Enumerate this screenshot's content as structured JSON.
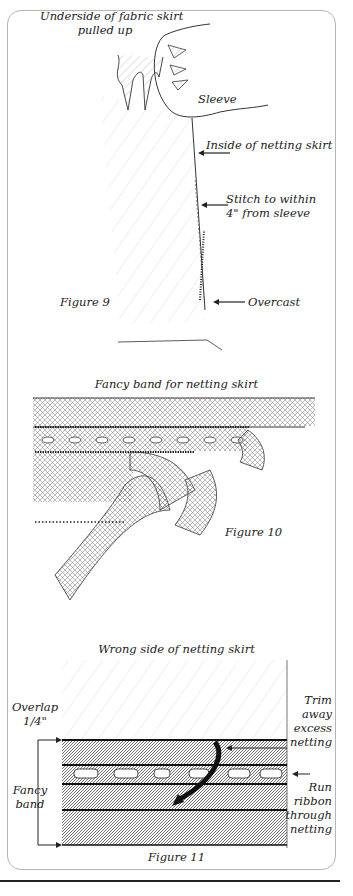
{
  "figure9": {
    "caption": "Figure 9",
    "labels": {
      "underside_line1": "Underside of fabric skirt",
      "underside_line2": "pulled up",
      "sleeve": "Sleeve",
      "inside_netting": "Inside of netting skirt",
      "stitch_line1": "Stitch to within",
      "stitch_line2": "4\" from sleeve",
      "overcast": "Overcast"
    }
  },
  "figure10": {
    "title": "Fancy band for netting skirt",
    "caption": "Figure 10"
  },
  "figure11": {
    "title": "Wrong side of netting skirt",
    "caption": "Figure 11",
    "labels": {
      "overlap_line1": "Overlap",
      "overlap_line2": "1/4\"",
      "fancy_line1": "Fancy",
      "fancy_line2": "band",
      "trim_line1": "Trim",
      "trim_line2": "away",
      "trim_line3": "excess",
      "trim_line4": "netting",
      "run_line1": "Run",
      "run_line2": "ribbon",
      "run_line3": "through",
      "run_line4": "netting"
    }
  }
}
